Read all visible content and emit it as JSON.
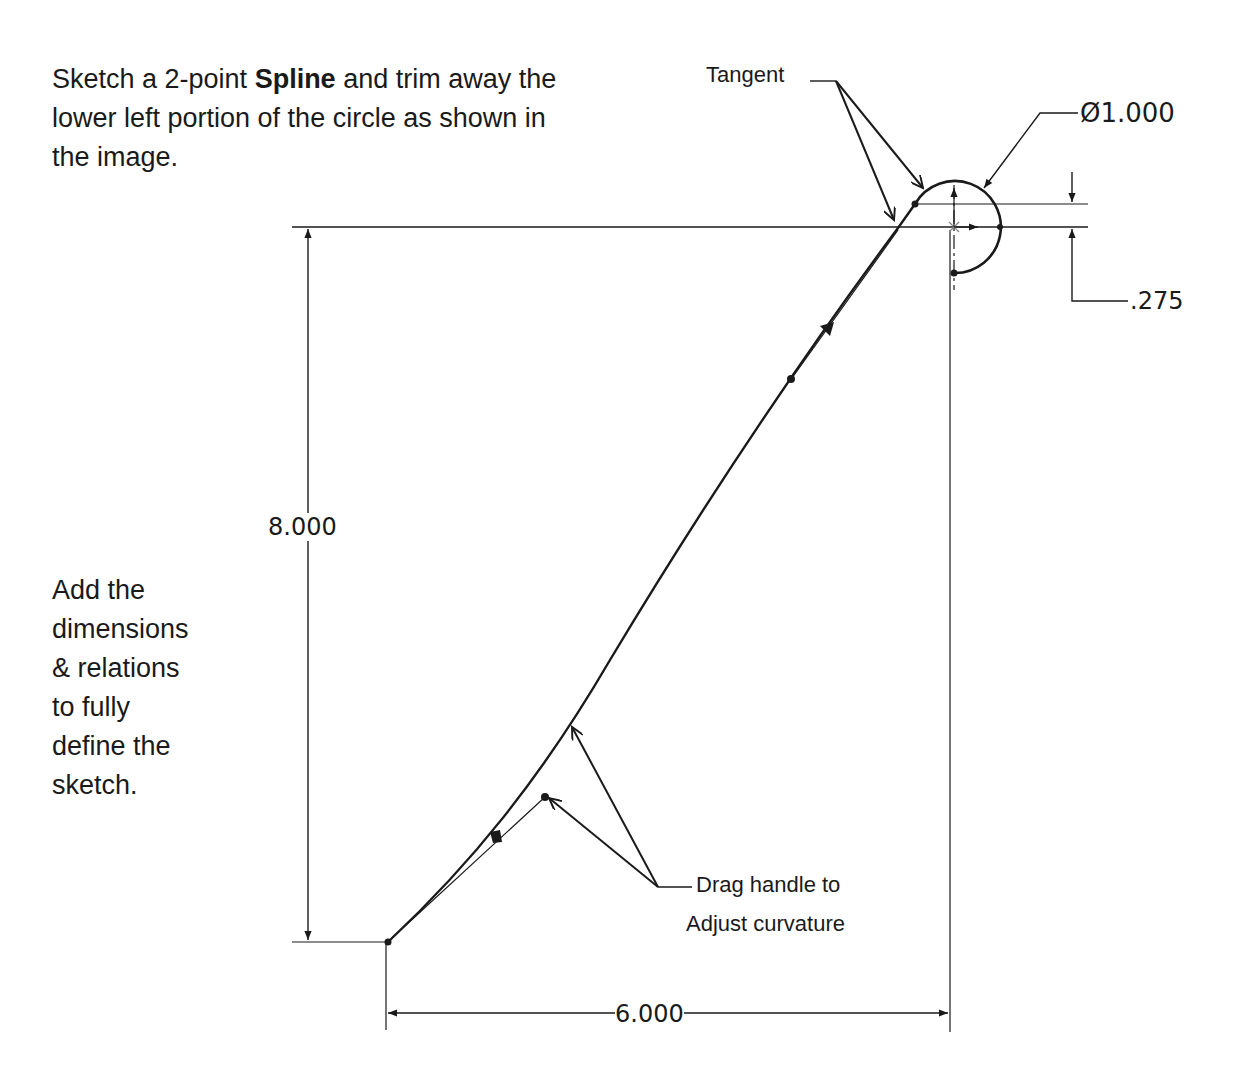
{
  "instructions": {
    "top": {
      "prefix": "Sketch a 2-point ",
      "bold": "Spline",
      "suffix": " and trim away the lower left portion of the circle as shown in the image."
    },
    "left": [
      "Add the",
      "dimensions",
      "& relations",
      "to fully",
      "define the",
      "sketch."
    ]
  },
  "callouts": {
    "tangent": "Tangent",
    "drag_handle_line1": "Drag handle to",
    "drag_handle_line2": "Adjust curvature"
  },
  "dimensions": {
    "diameter": "Ø1.000",
    "offset": ".275",
    "height": "8.000",
    "width": "6.000"
  },
  "colors": {
    "line": "#1a1a1a",
    "background": "#ffffff"
  }
}
